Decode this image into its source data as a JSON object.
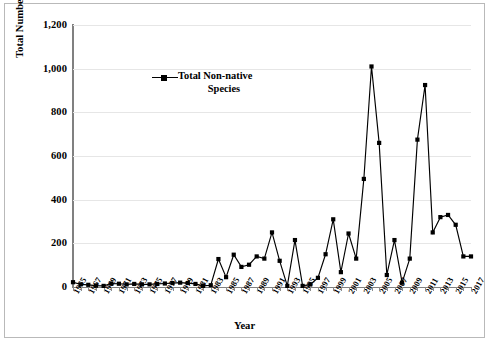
{
  "chart_data": {
    "type": "line",
    "title": "",
    "xlabel": "Year",
    "ylabel": "Total Number of Non-native Individuals",
    "ylim": [
      0,
      1200
    ],
    "xlim": [
      1965,
      2017
    ],
    "ytick_labels": [
      "0",
      "200",
      "400",
      "600",
      "800",
      "1,000",
      "1,200"
    ],
    "ytick_values": [
      0,
      200,
      400,
      600,
      800,
      1000,
      1200
    ],
    "xtick_labels": [
      "1965",
      "1967",
      "1969",
      "1971",
      "1973",
      "1975",
      "1977",
      "1979",
      "1981",
      "1983",
      "1985",
      "1987",
      "1989",
      "1991",
      "1993",
      "1995",
      "1997",
      "1999",
      "2001",
      "2003",
      "2005",
      "2007",
      "2009",
      "2011",
      "2013",
      "2015",
      "2017"
    ],
    "grid": true,
    "legend_position": "inside-upper-left",
    "legend": [
      {
        "name": "Total Non-native Species",
        "line1": "Total Non-native",
        "line2": "Species",
        "color": "#000000",
        "marker": "square"
      }
    ],
    "series": [
      {
        "name": "Total Non-native Species",
        "color": "#000000",
        "x": [
          1965,
          1966,
          1967,
          1968,
          1969,
          1970,
          1971,
          1972,
          1973,
          1974,
          1975,
          1976,
          1977,
          1978,
          1979,
          1980,
          1981,
          1982,
          1983,
          1984,
          1985,
          1986,
          1987,
          1988,
          1989,
          1990,
          1991,
          1992,
          1993,
          1994,
          1995,
          1996,
          1997,
          1998,
          1999,
          2000,
          2001,
          2002,
          2003,
          2004,
          2005,
          2006,
          2007,
          2008,
          2009,
          2010,
          2011,
          2012,
          2013,
          2014,
          2015,
          2016,
          2017
        ],
        "values": [
          22,
          12,
          10,
          6,
          5,
          16,
          15,
          12,
          14,
          12,
          12,
          14,
          16,
          18,
          20,
          18,
          14,
          5,
          8,
          128,
          45,
          148,
          92,
          102,
          140,
          130,
          250,
          120,
          5,
          215,
          5,
          12,
          42,
          150,
          310,
          68,
          245,
          130,
          495,
          1010,
          660,
          55,
          215,
          20,
          130,
          675,
          925,
          250,
          320,
          330,
          285,
          140,
          140
        ]
      }
    ]
  }
}
